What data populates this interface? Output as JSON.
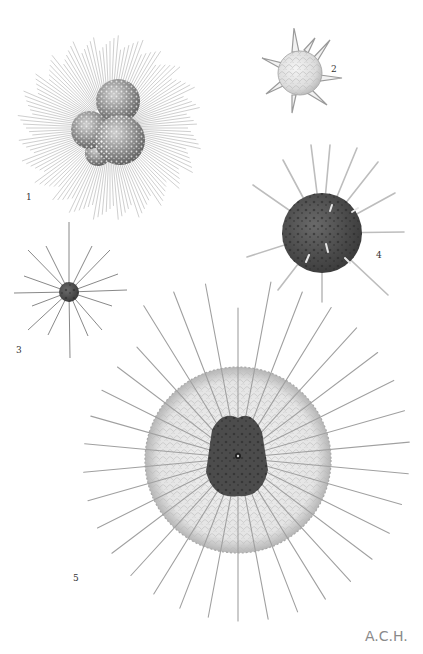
{
  "plate": {
    "background": "#ffffff",
    "signature": "A.C.H.",
    "figures": [
      {
        "number": "1",
        "label_pos": [
          26,
          197
        ],
        "center": [
          110,
          128
        ],
        "type": "multi-chamber-with-fine-spines"
      },
      {
        "number": "2",
        "label_pos": [
          331,
          69
        ],
        "center": [
          302,
          73
        ],
        "type": "bubbly-sphere-with-short-spikes"
      },
      {
        "number": "3",
        "label_pos": [
          16,
          350
        ],
        "center": [
          69,
          292
        ],
        "type": "small-dark-sphere-with-long-spines"
      },
      {
        "number": "4",
        "label_pos": [
          376,
          255
        ],
        "center": [
          322,
          233
        ],
        "type": "dark-mottled-sphere-with-spines"
      },
      {
        "number": "5",
        "label_pos": [
          73,
          578
        ],
        "center": [
          238,
          460
        ],
        "type": "translucent-sphere-with-barbed-spines"
      }
    ]
  },
  "colors": {
    "ink": "#3a3a3a",
    "dark_body": "#4a4a4a",
    "spine": "#9a9a9a",
    "halo": "#d6d6d6"
  }
}
